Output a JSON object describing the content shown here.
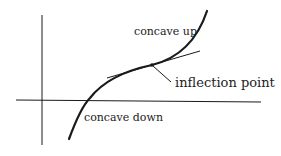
{
  "diagram": {
    "labels": {
      "concave_up": "concave up",
      "inflection_point": "inflection point",
      "concave_down": "concave down"
    },
    "colors": {
      "stroke": "#1a1a1a",
      "text": "#222222",
      "background": "#ffffff"
    }
  }
}
